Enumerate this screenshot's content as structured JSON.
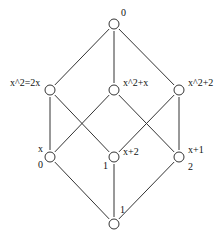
{
  "diagram": {
    "type": "hasse-diagram",
    "nodes": [
      {
        "id": "top",
        "x": 114,
        "y": 24,
        "labels": [
          {
            "text": "0",
            "x": 121,
            "y": 16
          }
        ]
      },
      {
        "id": "m-left",
        "x": 50,
        "y": 90,
        "labels": [
          {
            "text": "x^2=2x",
            "x": 10,
            "y": 86
          }
        ]
      },
      {
        "id": "m-center",
        "x": 114,
        "y": 90,
        "labels": [
          {
            "text": "x^2+x",
            "x": 123,
            "y": 86
          }
        ]
      },
      {
        "id": "m-right",
        "x": 179,
        "y": 90,
        "labels": [
          {
            "text": "x^2+2",
            "x": 188,
            "y": 86
          }
        ]
      },
      {
        "id": "l-left",
        "x": 50,
        "y": 157,
        "labels": [
          {
            "text": "x",
            "x": 38,
            "y": 152
          },
          {
            "text": "0",
            "x": 38,
            "y": 168
          }
        ]
      },
      {
        "id": "l-center",
        "x": 114,
        "y": 157,
        "labels": [
          {
            "text": "x+2",
            "x": 123,
            "y": 155
          },
          {
            "text": "1",
            "x": 103,
            "y": 169
          }
        ]
      },
      {
        "id": "l-right",
        "x": 179,
        "y": 157,
        "labels": [
          {
            "text": "x+1",
            "x": 188,
            "y": 153
          },
          {
            "text": "2",
            "x": 188,
            "y": 170
          }
        ]
      },
      {
        "id": "bottom",
        "x": 114,
        "y": 224,
        "labels": [
          {
            "text": "1",
            "x": 120,
            "y": 213
          }
        ]
      }
    ],
    "edges": [
      [
        "top",
        "m-left"
      ],
      [
        "top",
        "m-center"
      ],
      [
        "top",
        "m-right"
      ],
      [
        "m-left",
        "l-left"
      ],
      [
        "m-left",
        "l-center"
      ],
      [
        "m-center",
        "l-left"
      ],
      [
        "m-center",
        "l-right"
      ],
      [
        "m-right",
        "l-center"
      ],
      [
        "m-right",
        "l-right"
      ],
      [
        "l-left",
        "bottom"
      ],
      [
        "l-center",
        "bottom"
      ],
      [
        "l-right",
        "bottom"
      ]
    ],
    "node_radius": 5,
    "colors": {
      "stroke": "#333333",
      "text": "#111111",
      "background": "#ffffff"
    }
  }
}
